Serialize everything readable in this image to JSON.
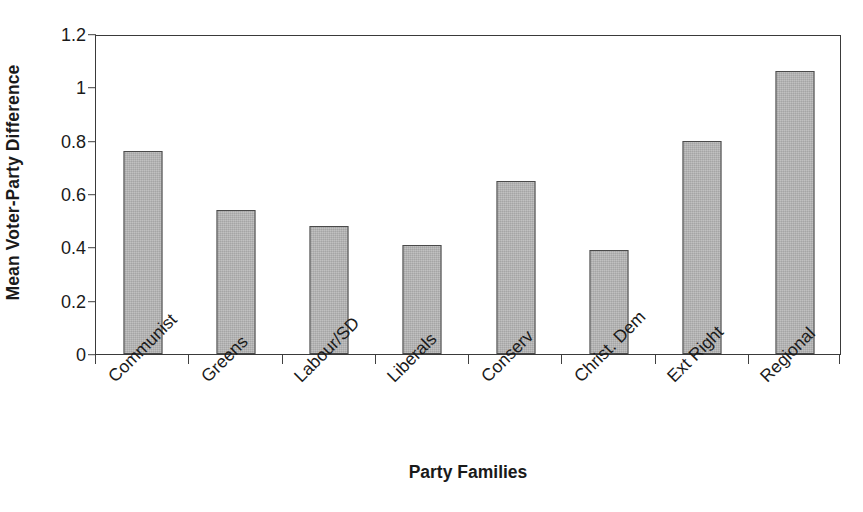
{
  "chart_data": {
    "type": "bar",
    "title": "",
    "xlabel": "Party Families",
    "ylabel": "Mean Voter-Party Difference",
    "categories": [
      "Communist",
      "Greens",
      "Labour/SD",
      "Liberals",
      "Conserv",
      "Christ. Dem",
      "Ext Right",
      "Regional"
    ],
    "values": [
      0.76,
      0.54,
      0.48,
      0.41,
      0.65,
      0.39,
      0.8,
      1.06
    ],
    "ylim": [
      0,
      1.2
    ],
    "ytick_values": [
      0,
      0.2,
      0.4,
      0.6,
      0.8,
      1,
      1.2
    ],
    "ytick_labels": [
      "0",
      "0.2",
      "0.4",
      "0.6",
      "0.8",
      "1",
      "1.2"
    ],
    "grid": false,
    "legend": null,
    "bar_fill_color": "#b3b3b3",
    "bar_border_color": "#4a4a4a",
    "axis_color": "#3a3a3a",
    "text_color": "#1a1a1a",
    "background_color": "#ffffff"
  }
}
